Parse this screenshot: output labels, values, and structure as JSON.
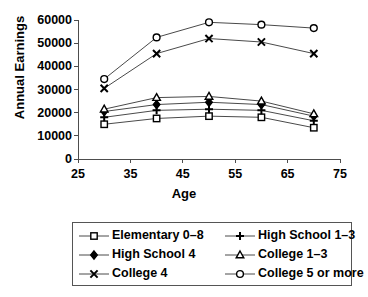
{
  "chart_data": {
    "type": "line",
    "title": "",
    "xlabel": "Age",
    "ylabel": "Annual Earnings",
    "x": [
      30,
      40,
      50,
      60,
      70
    ],
    "xlim": [
      25,
      75
    ],
    "ylim": [
      0,
      60000
    ],
    "xticks": [
      "25",
      "35",
      "45",
      "55",
      "65",
      "75"
    ],
    "xtick_values": [
      25,
      35,
      45,
      55,
      65,
      75
    ],
    "yticks": [
      "0",
      "10000",
      "20000",
      "30000",
      "40000",
      "50000",
      "60000"
    ],
    "ytick_values": [
      0,
      10000,
      20000,
      30000,
      40000,
      50000,
      60000
    ],
    "grid": false,
    "legend_position": "below",
    "series": [
      {
        "name": "Elementary 0–8",
        "marker": "open-square",
        "values": [
          15000,
          17500,
          18500,
          18000,
          13500
        ]
      },
      {
        "name": "High School 1–3",
        "marker": "plus",
        "values": [
          18000,
          21000,
          21500,
          21000,
          16500
        ]
      },
      {
        "name": "High School 4",
        "marker": "filled-diamond",
        "values": [
          20500,
          23500,
          24500,
          23500,
          18500
        ]
      },
      {
        "name": "College 1–3",
        "marker": "open-triangle",
        "values": [
          21500,
          26500,
          27000,
          25000,
          19500
        ]
      },
      {
        "name": "College 4",
        "marker": "cross-x",
        "values": [
          30500,
          45500,
          52000,
          50500,
          45500
        ]
      },
      {
        "name": "College 5 or more",
        "marker": "open-circle",
        "values": [
          34500,
          52500,
          59000,
          58000,
          56500
        ]
      }
    ],
    "colors": {
      "line": "#4a4a4a",
      "marker": "#000000",
      "axis": "#4d4d4d",
      "background": "#ffffff",
      "legend_border": "#555555"
    }
  },
  "legend": {
    "entries": [
      {
        "label": "Elementary 0–8",
        "marker": "open-square"
      },
      {
        "label": "High School 1–3",
        "marker": "plus"
      },
      {
        "label": "High School 4",
        "marker": "filled-diamond"
      },
      {
        "label": "College 1–3",
        "marker": "open-triangle"
      },
      {
        "label": "College 4",
        "marker": "cross-x"
      },
      {
        "label": "College 5 or more",
        "marker": "open-circle"
      }
    ]
  }
}
